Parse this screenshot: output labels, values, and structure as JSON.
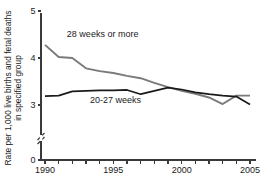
{
  "chart_data": {
    "type": "line",
    "title": "",
    "subtitle": "",
    "xlabel": "",
    "ylabel": "Rate per 1,000 live births and fetal deaths in specified group",
    "ylabel_line1": "Rate per 1,000 live births and fetal deaths",
    "ylabel_line2": "in specified group",
    "x": [
      1990,
      1991,
      1992,
      1993,
      1994,
      1995,
      1996,
      1997,
      1998,
      1999,
      2000,
      2001,
      2002,
      2003,
      2004,
      2005
    ],
    "xlim": [
      1990,
      2005
    ],
    "ylim": [
      0,
      5
    ],
    "y_axis_break": true,
    "y_break_between": [
      0,
      3
    ],
    "ytick_labels": [
      "0",
      "3",
      "4",
      "5"
    ],
    "ytick_values": [
      0,
      3,
      4,
      5
    ],
    "xtick_values": [
      1990,
      1991,
      1992,
      1993,
      1994,
      1995,
      1996,
      1997,
      1998,
      1999,
      2000,
      2001,
      2002,
      2003,
      2004,
      2005
    ],
    "xtick_labels_shown": [
      "1990",
      "1995",
      "2000",
      "2005"
    ],
    "xtick_labeled_values": [
      1990,
      1995,
      2000,
      2005
    ],
    "grid": false,
    "legend_position": "inline-annotation",
    "series": [
      {
        "name": "28 weeks or more",
        "color": "#7a7a7a",
        "label_x": 1991.6,
        "label_y": 4.45,
        "values": [
          4.28,
          4.02,
          4.0,
          3.78,
          3.72,
          3.68,
          3.62,
          3.57,
          3.47,
          3.38,
          3.3,
          3.24,
          3.16,
          3.02,
          3.2,
          3.2
        ]
      },
      {
        "name": "20-27 weeks",
        "color": "#1a1a1a",
        "label_x": 1993.3,
        "label_y": 3.05,
        "values": [
          3.19,
          3.2,
          3.29,
          3.3,
          3.31,
          3.31,
          3.32,
          3.23,
          3.3,
          3.37,
          3.33,
          3.27,
          3.23,
          3.2,
          3.18,
          3.01
        ]
      }
    ]
  }
}
